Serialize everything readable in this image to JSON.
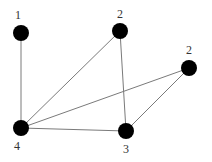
{
  "diagram": {
    "type": "graph",
    "width": 212,
    "height": 162,
    "node_radius": 8,
    "colors": {
      "node": "#000000",
      "edge": "#7a7a7a",
      "label": "#333333",
      "background": "#ffffff"
    },
    "nodes": [
      {
        "id": "n1",
        "label": "1",
        "x": 21,
        "y": 33,
        "label_x": 18,
        "label_y": 19
      },
      {
        "id": "n2a",
        "label": "2",
        "x": 120,
        "y": 31,
        "label_x": 120,
        "label_y": 18
      },
      {
        "id": "n2b",
        "label": "2",
        "x": 189,
        "y": 68,
        "label_x": 189,
        "label_y": 54
      },
      {
        "id": "n4",
        "label": "4",
        "x": 21,
        "y": 128,
        "label_x": 17,
        "label_y": 150
      },
      {
        "id": "n3",
        "label": "3",
        "x": 126,
        "y": 131,
        "label_x": 126,
        "label_y": 153
      }
    ],
    "edges": [
      {
        "from": "n1",
        "to": "n4"
      },
      {
        "from": "n2a",
        "to": "n4"
      },
      {
        "from": "n2a",
        "to": "n3"
      },
      {
        "from": "n2b",
        "to": "n4"
      },
      {
        "from": "n2b",
        "to": "n3"
      },
      {
        "from": "n4",
        "to": "n3"
      }
    ]
  }
}
